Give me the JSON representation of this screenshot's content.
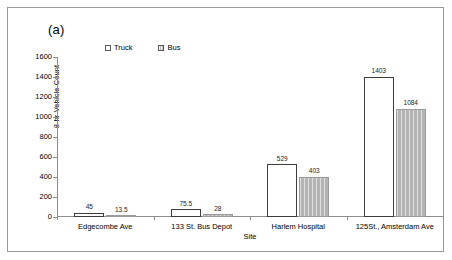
{
  "figure": {
    "panel_letter": "(a)"
  },
  "chart_data": {
    "type": "bar",
    "title": "",
    "panel_label": "(a)",
    "xlabel": "Site",
    "ylabel": "8-hr Vehicle Count",
    "ylim": [
      0,
      1600
    ],
    "ytick_step": 200,
    "yticks": [
      1600,
      1400,
      1200,
      1000,
      800,
      600,
      400,
      200,
      0
    ],
    "ytick_labels": [
      "1600",
      "1400",
      "1200",
      "1000",
      "800",
      "600",
      "400",
      "200",
      "0"
    ],
    "grid": false,
    "legend_position": "top-center",
    "categories": [
      "Edgecombe Ave",
      "133 St. Bus Depot",
      "Harlem Hospital",
      "125St., Amsterdam Ave"
    ],
    "series": [
      {
        "name": "Truck",
        "values": [
          45,
          75.5,
          529,
          1403
        ],
        "labels": [
          "45",
          "75.5",
          "529",
          "1403"
        ],
        "color": "#ffffff",
        "edge_color": "#3d3d3d",
        "pattern": "solid-white"
      },
      {
        "name": "Bus",
        "values": [
          13.5,
          28,
          403,
          1084
        ],
        "labels": [
          "13.5",
          "28",
          "403",
          "1084"
        ],
        "color": "#b4b4b4",
        "edge_color": "#9b9b9b",
        "pattern": "vertical-hatch-gray"
      }
    ]
  }
}
